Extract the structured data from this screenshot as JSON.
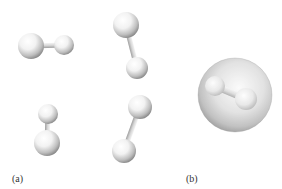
{
  "figure": {
    "panel_a": {
      "label": "(a)",
      "description": "Four diatomic molecules in different orientations",
      "molecules": [
        {
          "name": "molecule-1",
          "atoms": [
            {
              "cx": 31,
              "cy": 46,
              "r": 13
            },
            {
              "cx": 64,
              "cy": 45,
              "r": 10
            }
          ]
        },
        {
          "name": "molecule-2",
          "atoms": [
            {
              "cx": 126,
              "cy": 25,
              "r": 13
            },
            {
              "cx": 137,
              "cy": 68,
              "r": 11
            }
          ]
        },
        {
          "name": "molecule-3",
          "atoms": [
            {
              "cx": 48,
              "cy": 114,
              "r": 10
            },
            {
              "cx": 47,
              "cy": 143,
              "r": 13
            }
          ]
        },
        {
          "name": "molecule-4",
          "atoms": [
            {
              "cx": 140,
              "cy": 107,
              "r": 12
            },
            {
              "cx": 124,
              "cy": 151,
              "r": 12
            }
          ]
        }
      ]
    },
    "panel_b": {
      "label": "(b)",
      "description": "Diatomic molecule enclosed in a translucent sphere",
      "sphere": {
        "cx": 235,
        "cy": 95,
        "r": 37
      },
      "inner_atoms": [
        {
          "cx": 215,
          "cy": 86,
          "r": 10
        },
        {
          "cx": 246,
          "cy": 99,
          "r": 11
        }
      ]
    },
    "colors": {
      "atom_highlight": "#ffffff",
      "atom_shade": "#9a9a9a",
      "bond": "#c8c8c8",
      "sphere_outer": "#8e8e8e",
      "sphere_inner": "#e8e8e8",
      "label": "#333333"
    }
  }
}
